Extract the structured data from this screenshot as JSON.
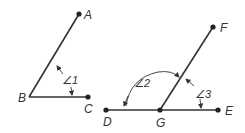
{
  "diagram": {
    "points": {
      "A": {
        "label": "A",
        "x": 79,
        "y": 14
      },
      "B": {
        "label": "B",
        "x": 29,
        "y": 97
      },
      "C": {
        "label": "C",
        "x": 88,
        "y": 97
      },
      "D": {
        "label": "D",
        "x": 106,
        "y": 110
      },
      "G": {
        "label": "G",
        "x": 160,
        "y": 110
      },
      "E": {
        "label": "E",
        "x": 218,
        "y": 110
      },
      "F": {
        "label": "F",
        "x": 213,
        "y": 27
      }
    },
    "angles": [
      {
        "label": "∠1",
        "vertex": "B",
        "rays": [
          "BA",
          "BC"
        ]
      },
      {
        "label": "∠2",
        "vertex": "G",
        "rays": [
          "GD",
          "GF"
        ]
      },
      {
        "label": "∠3",
        "vertex": "G",
        "rays": [
          "GF",
          "GE"
        ]
      }
    ],
    "colors": {
      "line": "#333333",
      "text": "#333333"
    }
  }
}
